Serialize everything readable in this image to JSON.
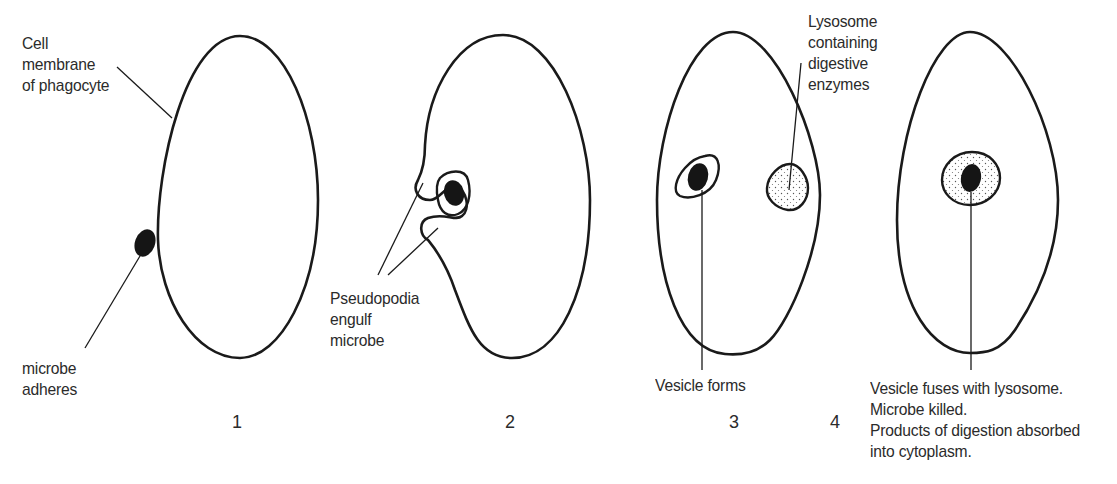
{
  "figure": {
    "stages": [
      {
        "number": "1",
        "labels": {
          "membrane": "Cell\nmembrane\nof phagocyte",
          "microbe": "microbe\nadheres"
        }
      },
      {
        "number": "2",
        "labels": {
          "pseudopodia": "Pseudopodia\nengulf\nmicrobe"
        }
      },
      {
        "number": "3",
        "labels": {
          "lysosome": "Lysosome\ncontaining\ndigestive\nenzymes",
          "vesicle": "Vesicle forms"
        }
      },
      {
        "number": "4",
        "labels": {
          "fusion": "Vesicle fuses with lysosome.\nMicrobe killed.\nProducts of digestion absorbed\ninto cytoplasm."
        }
      }
    ],
    "colors": {
      "outline": "#1a1a1a",
      "text": "#2b2b2b",
      "microbe": "#151515",
      "background": "#ffffff"
    }
  }
}
